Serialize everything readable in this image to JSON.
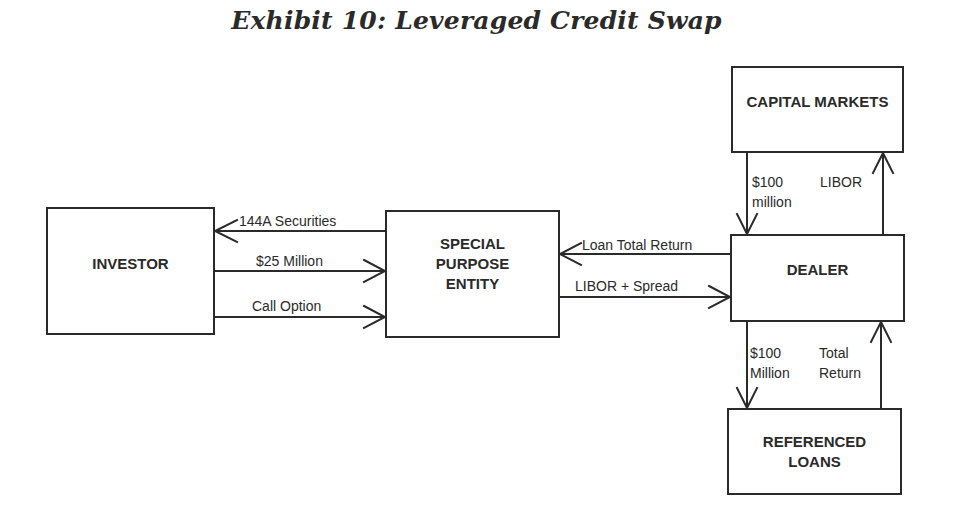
{
  "title": "Exhibit 10: Leveraged Credit Swap",
  "nodes": {
    "investor": {
      "label": "INVESTOR"
    },
    "spe": {
      "label": "SPECIAL\nPURPOSE\nENTITY"
    },
    "dealer": {
      "label": "DEALER"
    },
    "capital_markets": {
      "label": "CAPITAL MARKETS"
    },
    "referenced_loans": {
      "label": "REFERENCED\nLOANS"
    }
  },
  "edges": [
    {
      "from": "spe",
      "to": "investor",
      "label": "144A Securities"
    },
    {
      "from": "investor",
      "to": "spe",
      "label": "$25 Million"
    },
    {
      "from": "investor",
      "to": "spe",
      "label": "Call Option"
    },
    {
      "from": "dealer",
      "to": "spe",
      "label": "Loan Total Return"
    },
    {
      "from": "spe",
      "to": "dealer",
      "label": "LIBOR + Spread"
    },
    {
      "from": "capital_markets",
      "to": "dealer",
      "label": "$100\nmillion"
    },
    {
      "from": "dealer",
      "to": "capital_markets",
      "label": "LIBOR"
    },
    {
      "from": "dealer",
      "to": "referenced_loans",
      "label": "$100\nMillion"
    },
    {
      "from": "referenced_loans",
      "to": "dealer",
      "label": "Total\nReturn"
    }
  ],
  "colors": {
    "stroke": "#2a2a2a",
    "background": "#ffffff"
  }
}
